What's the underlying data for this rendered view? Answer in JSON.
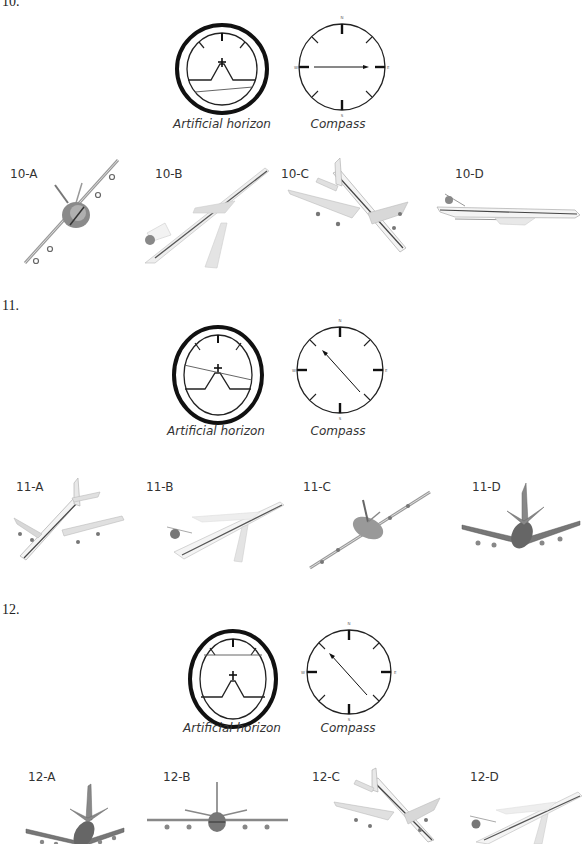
{
  "questions": [
    {
      "number": "10.",
      "instruments": {
        "horizon_label": "Artificial horizon",
        "compass_label": "Compass",
        "horizon_bank_deg": -5,
        "horizon_offset": "low",
        "compass_heading": "E",
        "compass_letters": {
          "n": "N",
          "e": "E",
          "s": "S",
          "w": "W"
        }
      },
      "options": [
        {
          "label": "10-A",
          "view": "head-on, steep left bank"
        },
        {
          "label": "10-B",
          "view": "climbing toward upper right"
        },
        {
          "label": "10-C",
          "view": "descending toward lower right"
        },
        {
          "label": "10-D",
          "view": "level flight, side view heading right"
        }
      ]
    },
    {
      "number": "11.",
      "instruments": {
        "horizon_label": "Artificial horizon",
        "compass_label": "Compass",
        "horizon_bank_deg": 12,
        "horizon_offset": "center",
        "compass_heading": "SE",
        "compass_letters": {
          "n": "N",
          "e": "E",
          "s": "S",
          "w": "W"
        }
      },
      "options": [
        {
          "label": "11-A",
          "view": "diving toward lower left"
        },
        {
          "label": "11-B",
          "view": "climbing toward upper right"
        },
        {
          "label": "11-C",
          "view": "rear view banked"
        },
        {
          "label": "11-D",
          "view": "rear view, slight bank"
        }
      ]
    },
    {
      "number": "12.",
      "instruments": {
        "horizon_label": "Artificial horizon",
        "compass_label": "Compass",
        "horizon_bank_deg": 0,
        "horizon_offset": "high",
        "compass_heading": "SE",
        "compass_letters": {
          "n": "N",
          "e": "E",
          "s": "S",
          "w": "W"
        }
      },
      "options": [
        {
          "label": "12-A",
          "view": "rear view, banked"
        },
        {
          "label": "12-B",
          "view": "rear view, level"
        },
        {
          "label": "12-C",
          "view": "descending toward lower right"
        },
        {
          "label": "12-D",
          "view": "climbing toward upper right"
        }
      ]
    }
  ]
}
